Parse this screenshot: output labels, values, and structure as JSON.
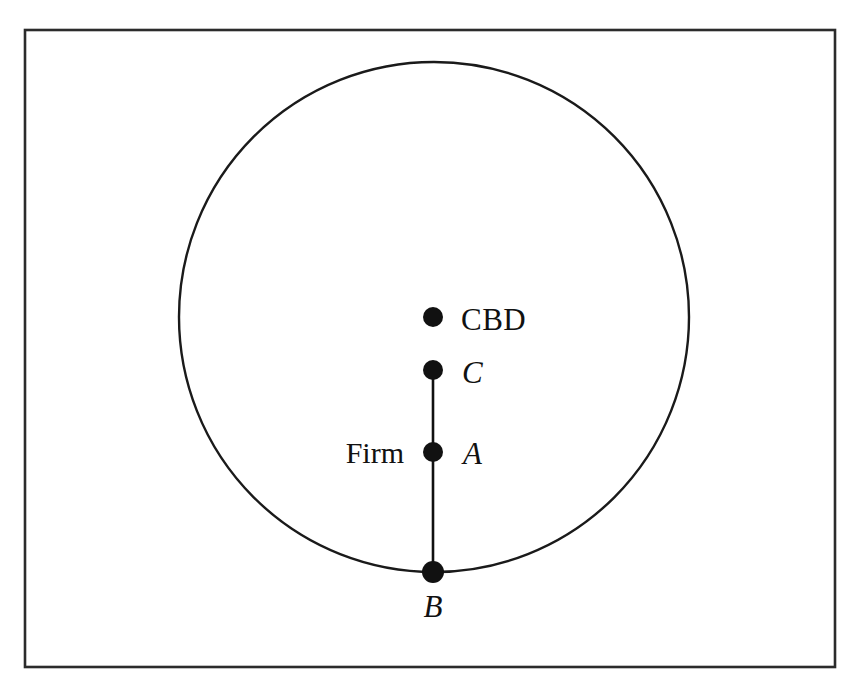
{
  "figure": {
    "background_color": "#ffffff",
    "ink_color": "#111111"
  },
  "frame": {
    "name": "figure-border",
    "x": 25,
    "y": 30,
    "width": 810,
    "height": 637,
    "stroke_color": "#2b2b2b"
  },
  "city_boundary": {
    "shape": "circle",
    "center_x": 434,
    "center_y": 317,
    "radius": 255,
    "stroke_color": "#1a1a1a"
  },
  "radial_line": {
    "name": "radius-segment-C-to-B",
    "x": 433,
    "y_top": 370,
    "y_bottom": 572,
    "stroke_color": "#111111"
  },
  "points": [
    {
      "id": "cbd",
      "label": "CBD",
      "label_style": "upright",
      "label_side": "right",
      "x": 433,
      "y": 317,
      "radius": 10
    },
    {
      "id": "c",
      "label": "C",
      "label_style": "italic",
      "label_side": "right",
      "x": 433,
      "y": 370,
      "radius": 10
    },
    {
      "id": "a",
      "label": "A",
      "label_style": "italic",
      "label_side": "right",
      "secondary_label": "Firm",
      "secondary_label_style": "roman",
      "secondary_label_side": "left",
      "x": 433,
      "y": 452,
      "radius": 10
    },
    {
      "id": "b",
      "label": "B",
      "label_style": "italic",
      "label_side": "below",
      "x": 433,
      "y": 572,
      "radius": 11
    }
  ],
  "labels": {
    "cbd": "CBD",
    "c": "C",
    "a": "A",
    "b": "B",
    "firm": "Firm"
  }
}
